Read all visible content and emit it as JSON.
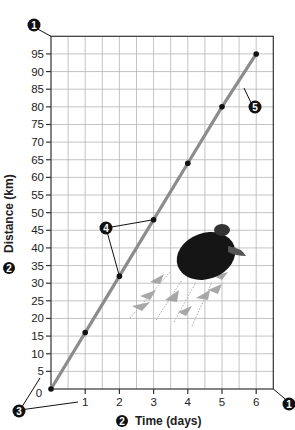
{
  "chart_data": {
    "type": "line",
    "title": "",
    "xlabel": "Time (days)",
    "ylabel": "Distance (km)",
    "x": [
      0,
      1,
      2,
      3,
      4,
      5,
      6
    ],
    "series": [
      {
        "name": "Turtle travel",
        "values": [
          0,
          16,
          32,
          48,
          64,
          80,
          95
        ],
        "color": "#8c8c8c",
        "marker_color": "#111111"
      }
    ],
    "xticks": [
      1,
      2,
      3,
      4,
      5,
      6
    ],
    "yticks": [
      0,
      5,
      10,
      15,
      20,
      25,
      30,
      35,
      40,
      45,
      50,
      55,
      60,
      65,
      70,
      75,
      80,
      85,
      90,
      95
    ],
    "xlim": [
      0,
      6.5
    ],
    "ylim": [
      0,
      100
    ],
    "grid": true,
    "legend": "none",
    "annotations": [
      {
        "label": "1",
        "target": "plot-area corners (top-left and bottom-right)"
      },
      {
        "label": "2",
        "target": "axis titles"
      },
      {
        "label": "3",
        "target": "first tick labels on axes"
      },
      {
        "label": "4",
        "target": "data points (2,32) and (3,48)"
      },
      {
        "label": "5",
        "target": "trend line"
      }
    ]
  },
  "labels": {
    "x_title": "Time (days)",
    "y_title": "Distance (km)",
    "x_origin": "0",
    "callouts": [
      "1",
      "2",
      "3",
      "4",
      "5"
    ]
  },
  "colors": {
    "grid": "#b5b5b5",
    "axis": "#333333",
    "line": "#8c8c8c",
    "marker": "#111111",
    "callout": "#111111"
  }
}
